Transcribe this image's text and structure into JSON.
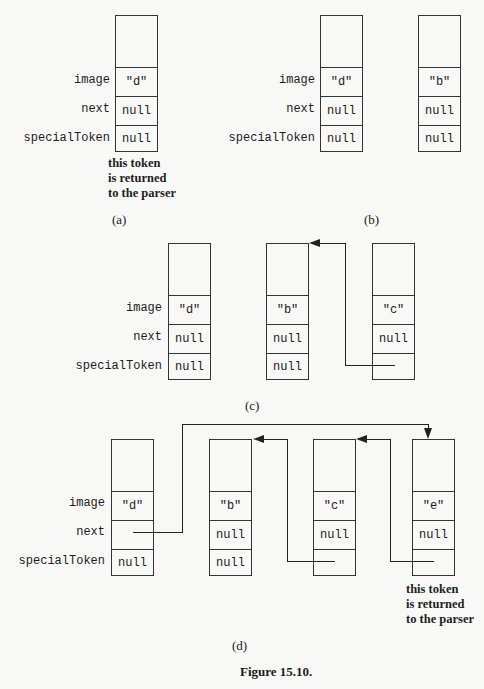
{
  "field_labels": {
    "image": "image",
    "next": "next",
    "special": "specialToken"
  },
  "panels": {
    "a": {
      "label": "(a)",
      "tokens": [
        {
          "image": "\"d\"",
          "next": "null",
          "special": "null"
        }
      ],
      "note": [
        "this token",
        "is returned",
        "to the parser"
      ]
    },
    "b": {
      "label": "(b)",
      "tokens": [
        {
          "image": "\"d\"",
          "next": "null",
          "special": "null"
        },
        {
          "image": "\"b\"",
          "next": "null",
          "special": "null"
        }
      ]
    },
    "c": {
      "label": "(c)",
      "tokens": [
        {
          "image": "\"d\"",
          "next": "null",
          "special": "null"
        },
        {
          "image": "\"b\"",
          "next": "null",
          "special": "null"
        },
        {
          "image": "\"c\"",
          "next": "null",
          "special": ""
        }
      ]
    },
    "d": {
      "label": "(d)",
      "tokens": [
        {
          "image": "\"d\"",
          "next": "",
          "special": "null"
        },
        {
          "image": "\"b\"",
          "next": "null",
          "special": "null"
        },
        {
          "image": "\"c\"",
          "next": "null",
          "special": ""
        },
        {
          "image": "\"e\"",
          "next": "null",
          "special": ""
        }
      ],
      "note": [
        "this token",
        "is returned",
        "to the parser"
      ]
    }
  },
  "caption": "Figure 15.10."
}
